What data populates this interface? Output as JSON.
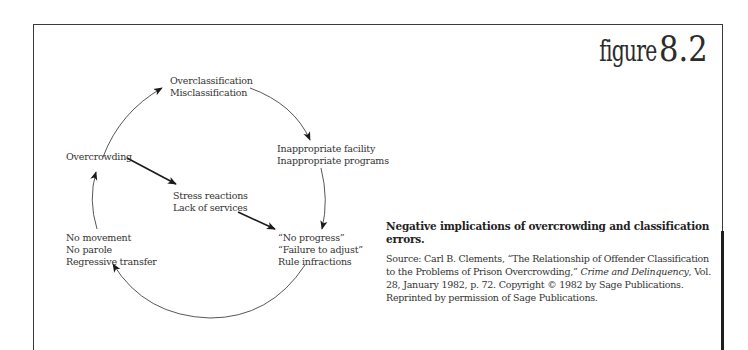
{
  "figure": {
    "label_word": "figure",
    "label_number": "8.2"
  },
  "diagram": {
    "type": "cycle",
    "nodes": {
      "overclassification": [
        "Overclassification",
        "Misclassification"
      ],
      "inappropriate": [
        "Inappropriate facility",
        "Inappropriate programs"
      ],
      "no_progress": [
        "“No progress”",
        "“Failure to adjust”",
        "Rule infractions"
      ],
      "no_movement": [
        "No movement",
        "No parole",
        "Regressive transfer"
      ],
      "overcrowding": [
        "Overcrowding"
      ],
      "stress": [
        "Stress reactions",
        "Lack of services"
      ]
    },
    "edges": [
      {
        "from": "Overcrowding",
        "to": "Overclassification / Misclassification"
      },
      {
        "from": "Overclassification / Misclassification",
        "to": "Inappropriate facility / Inappropriate programs"
      },
      {
        "from": "Inappropriate facility / Inappropriate programs",
        "to": "No progress / Failure to adjust / Rule infractions"
      },
      {
        "from": "No progress / Failure to adjust / Rule infractions",
        "to": "No movement / No parole / Regressive transfer"
      },
      {
        "from": "No movement / No parole / Regressive transfer",
        "to": "Overcrowding"
      },
      {
        "from": "Overcrowding",
        "to": "Stress reactions / Lack of services"
      },
      {
        "from": "Stress reactions / Lack of services",
        "to": "No progress / Failure to adjust / Rule infractions"
      }
    ]
  },
  "caption": {
    "title": "Negative implications of overcrowding and classification errors.",
    "source_prefix": "Source: Carl B. Clements, “The Relationship of Offender Classification to the Problems of Prison Overcrowding,” ",
    "source_journal": "Crime and Delinquency",
    "source_suffix": ", Vol. 28, January 1982, p. 72. Copyright © 1982 by Sage Publications. Reprinted by permission of Sage Publications."
  }
}
